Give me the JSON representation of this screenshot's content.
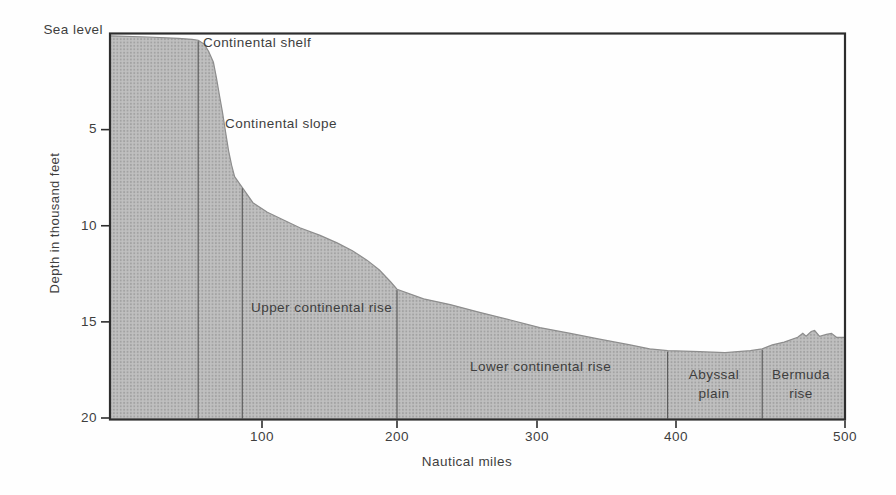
{
  "chart_data": {
    "type": "area",
    "xlabel": "Nautical miles",
    "ylabel": "Depth in thousand feet",
    "sea_level_label": "Sea level",
    "x_ticks": [
      100,
      200,
      300,
      400,
      500
    ],
    "y_ticks": [
      5,
      10,
      15,
      20
    ],
    "xlim": [
      0,
      500
    ],
    "ylim_depth_thousand_feet": [
      0,
      20
    ],
    "profile_nm_depth": [
      [
        0,
        0.12
      ],
      [
        25,
        0.18
      ],
      [
        45,
        0.25
      ],
      [
        54,
        0.3
      ],
      [
        58,
        0.35
      ],
      [
        62,
        0.55
      ],
      [
        65,
        0.95
      ],
      [
        68,
        1.5
      ],
      [
        70,
        2.3
      ],
      [
        72,
        3.2
      ],
      [
        74,
        4.1
      ],
      [
        76,
        5.1
      ],
      [
        78,
        6.1
      ],
      [
        80,
        6.85
      ],
      [
        82,
        7.45
      ],
      [
        87,
        8.0
      ],
      [
        94,
        8.8
      ],
      [
        104,
        9.3
      ],
      [
        116,
        9.7
      ],
      [
        128,
        10.1
      ],
      [
        143,
        10.5
      ],
      [
        156,
        10.9
      ],
      [
        167,
        11.3
      ],
      [
        178,
        11.8
      ],
      [
        187,
        12.3
      ],
      [
        195,
        12.9
      ],
      [
        200,
        13.3
      ],
      [
        219,
        13.8
      ],
      [
        238,
        14.1
      ],
      [
        259,
        14.5
      ],
      [
        281,
        14.9
      ],
      [
        302,
        15.3
      ],
      [
        324,
        15.6
      ],
      [
        345,
        15.9
      ],
      [
        367,
        16.2
      ],
      [
        381,
        16.4
      ],
      [
        394,
        16.5
      ],
      [
        414,
        16.55
      ],
      [
        429,
        16.6
      ],
      [
        444,
        16.5
      ],
      [
        451,
        16.4
      ],
      [
        457,
        16.2
      ],
      [
        464,
        16.05
      ],
      [
        472,
        15.8
      ],
      [
        475,
        15.6
      ],
      [
        477,
        15.75
      ],
      [
        480,
        15.5
      ],
      [
        482,
        15.45
      ],
      [
        485,
        15.75
      ],
      [
        489,
        15.65
      ],
      [
        492,
        15.6
      ],
      [
        495,
        15.8
      ],
      [
        500,
        15.8
      ]
    ],
    "region_boundaries": [
      {
        "nm": 58,
        "surface_depth_kft": 0.35
      },
      {
        "nm": 87,
        "surface_depth_kft": 8.0
      },
      {
        "nm": 200,
        "surface_depth_kft": 13.3
      },
      {
        "nm": 394,
        "surface_depth_kft": 16.5
      },
      {
        "nm": 451,
        "surface_depth_kft": 16.4
      }
    ],
    "regions": [
      {
        "label": "Continental shelf",
        "from_nm": 0,
        "to_nm": 58
      },
      {
        "label": "Continental slope",
        "from_nm": 58,
        "to_nm": 87
      },
      {
        "label": "Upper continental rise",
        "from_nm": 87,
        "to_nm": 200
      },
      {
        "label": "Lower continental rise",
        "from_nm": 200,
        "to_nm": 394
      },
      {
        "label": "Abyssal plain",
        "from_nm": 394,
        "to_nm": 451
      },
      {
        "label": "Bermuda rise",
        "from_nm": 451,
        "to_nm": 500
      }
    ],
    "colors": {
      "fill": "#c0c0c0",
      "halftone_dot": "#a2a2a2",
      "axis_line": "#2d2d2d",
      "boundary_line": "#4d4d4d",
      "surface_edge": "#8d8d8d",
      "text": "#3e3e3e",
      "background": "#fefefe"
    },
    "legend": null,
    "grid": false
  },
  "annotations": {
    "abyssal_plain": {
      "line1": "Abyssal",
      "line2": "plain"
    },
    "bermuda_rise": {
      "line1": "Bermuda",
      "line2": "rise"
    }
  }
}
